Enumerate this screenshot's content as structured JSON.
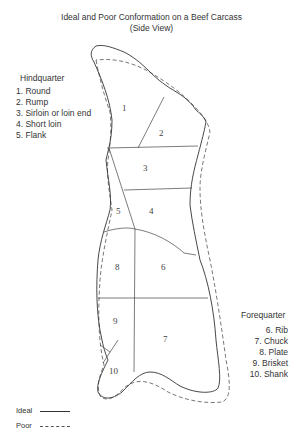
{
  "title": "Ideal and Poor Conformation on a Beef Carcass",
  "subtitle": "(Side View)",
  "hindquarter": {
    "heading": "Hindquarter",
    "items": [
      "1. Round",
      "2. Rump",
      "3. Sirloin or loin end",
      "4. Short loin",
      "5. Flank"
    ]
  },
  "forequarter": {
    "heading": "Forequarter",
    "items": [
      "6. Rib",
      "7. Chuck",
      "8. Plate",
      "9. Brisket",
      "10. Shank"
    ]
  },
  "regions": [
    {
      "id": "1",
      "name": "Round"
    },
    {
      "id": "2",
      "name": "Rump"
    },
    {
      "id": "3",
      "name": "Sirloin or loin end"
    },
    {
      "id": "4",
      "name": "Short loin"
    },
    {
      "id": "5",
      "name": "Flank"
    },
    {
      "id": "6",
      "name": "Rib"
    },
    {
      "id": "7",
      "name": "Chuck"
    },
    {
      "id": "8",
      "name": "Plate"
    },
    {
      "id": "9",
      "name": "Brisket"
    },
    {
      "id": "10",
      "name": "Shank"
    }
  ],
  "key": {
    "ideal_label": "Ideal",
    "ideal_style": "solid line",
    "poor_label": "Poor",
    "poor_style": "dashed line"
  },
  "colors": {
    "ideal_line": "#333333",
    "poor_line": "#555555",
    "text": "#333333"
  }
}
